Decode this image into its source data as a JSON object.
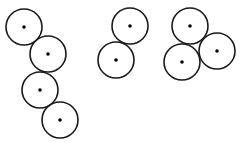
{
  "diagram": {
    "background": "#ffffff",
    "stroke_color": "#1a1a1a",
    "dot_color": "#000000",
    "radius": 18,
    "dot_radius": 1.8,
    "stroke_width": 1.6,
    "groups": [
      {
        "name": "chain-of-four",
        "circles": [
          {
            "cx": 24,
            "cy": 27
          },
          {
            "cx": 48,
            "cy": 54
          },
          {
            "cx": 40,
            "cy": 90
          },
          {
            "cx": 60,
            "cy": 120
          }
        ]
      },
      {
        "name": "pair",
        "circles": [
          {
            "cx": 130,
            "cy": 26
          },
          {
            "cx": 116,
            "cy": 60
          }
        ]
      },
      {
        "name": "triangle-of-three",
        "circles": [
          {
            "cx": 190,
            "cy": 26
          },
          {
            "cx": 182,
            "cy": 62
          },
          {
            "cx": 217,
            "cy": 51
          }
        ]
      }
    ]
  }
}
